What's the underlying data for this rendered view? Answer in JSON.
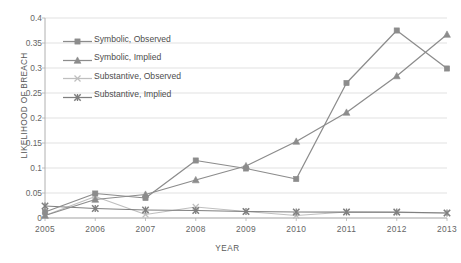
{
  "chart_data": {
    "type": "line",
    "title": "",
    "xlabel": "YEAR",
    "ylabel": "LIKELIHOOD OF BREACH",
    "x": [
      2005,
      2006,
      2007,
      2008,
      2009,
      2010,
      2011,
      2012,
      2013
    ],
    "categories": [
      "2005",
      "2006",
      "2007",
      "2008",
      "2009",
      "2010",
      "2011",
      "2012",
      "2013"
    ],
    "xlim": [
      2005,
      2013
    ],
    "ylim": [
      0,
      0.4
    ],
    "yticks": [
      0,
      0.05,
      0.1,
      0.15,
      0.2,
      0.25,
      0.3,
      0.35,
      0.4
    ],
    "ytick_labels": [
      "0",
      "0.05",
      "0.1",
      "0.15",
      "0.2",
      "0.25",
      "0.3",
      "0.35",
      "0.4"
    ],
    "grid": "horizontal",
    "legend_position": "upper-left-inside",
    "series": [
      {
        "name": "Symbolic, Observed",
        "marker": "square",
        "color": "#8c8c8c",
        "values": [
          0.012,
          0.049,
          0.04,
          0.115,
          0.099,
          0.078,
          0.27,
          0.375,
          0.299
        ]
      },
      {
        "name": "Symbolic, Implied",
        "marker": "triangle",
        "color": "#8c8c8c",
        "values": [
          0.005,
          0.037,
          0.047,
          0.076,
          0.104,
          0.153,
          0.211,
          0.284,
          0.367
        ]
      },
      {
        "name": "Substantive, Observed",
        "marker": "x",
        "color": "#bfbfbf",
        "values": [
          0.005,
          0.043,
          0.007,
          0.022,
          0.013,
          0.005,
          0.012,
          0.011,
          0.01
        ]
      },
      {
        "name": "Substantive, Implied",
        "marker": "star-x",
        "color": "#7f7f7f",
        "values": [
          0.024,
          0.019,
          0.016,
          0.015,
          0.013,
          0.012,
          0.012,
          0.012,
          0.01
        ]
      }
    ]
  },
  "legend": {
    "items": [
      {
        "label": "Symbolic, Observed"
      },
      {
        "label": "Symbolic, Implied"
      },
      {
        "label": "Substantive, Observed"
      },
      {
        "label": "Substantive, Implied"
      }
    ]
  },
  "axes": {
    "y_title": "LIKELIHOOD OF BREACH",
    "x_title": "YEAR"
  }
}
